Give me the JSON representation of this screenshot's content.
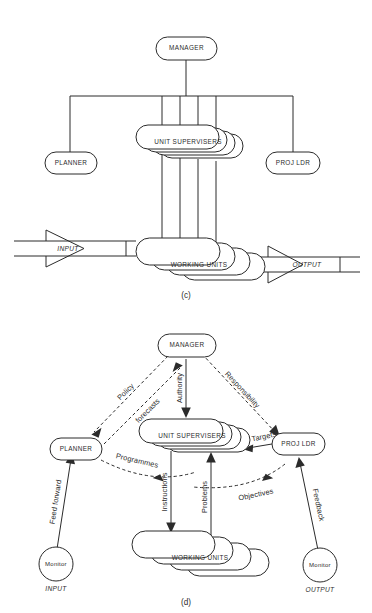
{
  "figure": {
    "panels": [
      {
        "id": "c",
        "caption": "(c)",
        "nodes": {
          "manager": "MANAGER",
          "unit_supervisers": "UNIT SUPERVISERS",
          "planner": "PLANNER",
          "proj_ldr": "PROJ LDR",
          "working_units": "WORKING UNITS"
        },
        "io": {
          "input": "INPUT",
          "output": "OUTPUT"
        }
      },
      {
        "id": "d",
        "caption": "(d)",
        "nodes": {
          "manager": "MANAGER",
          "unit_supervisers": "UNIT SUPERVISERS",
          "planner": "PLANNER",
          "proj_ldr": "PROJ LDR",
          "working_units": "WORKING UNITS",
          "monitor_input": "Monitor",
          "monitor_output": "Monitor"
        },
        "io": {
          "input": "INPUT",
          "output": "OUTPUT"
        },
        "flows": {
          "policy": "Policy",
          "forecasts": "forecasts",
          "authority": "Authority",
          "responsibility": "Responsibility",
          "targets": "Targets",
          "programmes": "Programmes",
          "instructions": "Instructions",
          "problems": "Problems",
          "objectives": "Objectives",
          "feed_forward": "Feed forward",
          "feedback": "Feedback"
        }
      }
    ],
    "colors": {
      "ink": "#2b2b2b",
      "paper": "#ffffff"
    }
  }
}
